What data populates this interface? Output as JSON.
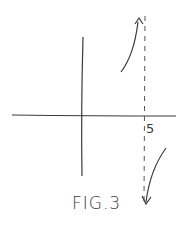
{
  "figure": {
    "caption": "FIG.3",
    "asymptote_label": "5",
    "colors": {
      "ink": "#3a3a3a",
      "background": "#ffffff"
    },
    "elements": [
      "x-axis",
      "y-axis",
      "vertical-asymptote-dashed-at-x-5",
      "curve-left-of-asymptote-rising-to-positive-infinity",
      "curve-right-of-asymptote-falling-to-negative-infinity"
    ]
  }
}
